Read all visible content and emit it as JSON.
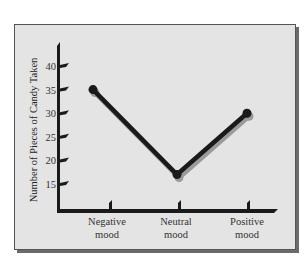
{
  "chart_data": {
    "type": "line",
    "title": "",
    "xlabel": "",
    "ylabel": "Number of Pieces of Candy Taken",
    "categories": [
      "Negative mood",
      "Neutral mood",
      "Positive mood"
    ],
    "category_lines": [
      [
        "Negative",
        "mood"
      ],
      [
        "Neutral",
        "mood"
      ],
      [
        "Positive",
        "mood"
      ]
    ],
    "series": [
      {
        "name": "Candy taken",
        "values": [
          35,
          17,
          30
        ]
      }
    ],
    "yticks": [
      15,
      20,
      25,
      30,
      35,
      40
    ],
    "ylim": [
      10,
      45
    ],
    "grid": false,
    "legend": "none"
  },
  "colors": {
    "panel_bg": "#e4e4e4",
    "line": "#1a1a1a",
    "shadow": "#9a9a9a",
    "axis": "#1a1a1a"
  }
}
